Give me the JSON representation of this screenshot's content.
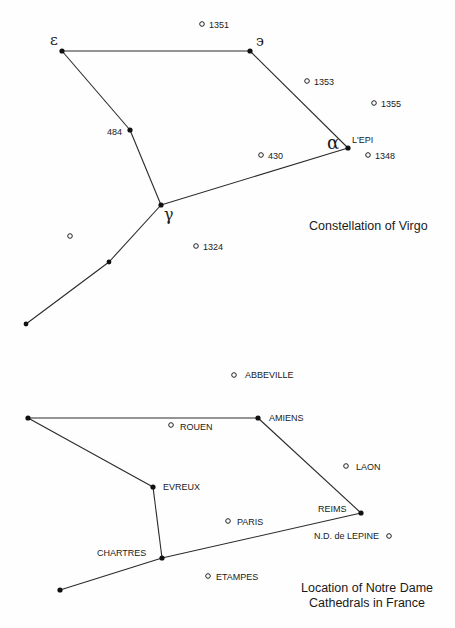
{
  "virgo": {
    "title": "Constellation of Virgo",
    "stars": [
      {
        "id": "epsilon",
        "label": "ε",
        "kind": "greek"
      },
      {
        "id": "eta",
        "label": "э",
        "kind": "greek"
      },
      {
        "id": "s484",
        "label": "484",
        "kind": "text"
      },
      {
        "id": "alpha",
        "label": "α",
        "kind": "greek",
        "sublabel": "L'EPI"
      },
      {
        "id": "gamma",
        "label": "γ",
        "kind": "greek"
      },
      {
        "id": "mid",
        "label": "",
        "kind": "none"
      },
      {
        "id": "end",
        "label": "",
        "kind": "none"
      }
    ],
    "edges": [
      [
        "epsilon",
        "eta"
      ],
      [
        "epsilon",
        "s484"
      ],
      [
        "s484",
        "gamma"
      ],
      [
        "eta",
        "alpha"
      ],
      [
        "alpha",
        "gamma"
      ],
      [
        "gamma",
        "mid"
      ],
      [
        "mid",
        "end"
      ]
    ],
    "other_points": [
      {
        "id": "p1351",
        "label": "1351"
      },
      {
        "id": "p1353",
        "label": "1353"
      },
      {
        "id": "p1355",
        "label": "1355"
      },
      {
        "id": "p430",
        "label": "430"
      },
      {
        "id": "p1348",
        "label": "1348"
      },
      {
        "id": "punl",
        "label": ""
      },
      {
        "id": "p1324",
        "label": "1324"
      }
    ]
  },
  "france": {
    "title_line1": "Location of Notre Dame",
    "title_line2": "Cathedrals in France",
    "cathedrals": [
      {
        "id": "west",
        "label": ""
      },
      {
        "id": "amiens",
        "label": "AMIENS"
      },
      {
        "id": "evreux",
        "label": "EVREUX"
      },
      {
        "id": "reims",
        "label": "REIMS"
      },
      {
        "id": "chartres",
        "label": "CHARTRES"
      },
      {
        "id": "southwest",
        "label": ""
      }
    ],
    "edges": [
      [
        "west",
        "amiens"
      ],
      [
        "west",
        "evreux"
      ],
      [
        "evreux",
        "chartres"
      ],
      [
        "amiens",
        "reims"
      ],
      [
        "reims",
        "chartres"
      ],
      [
        "chartres",
        "southwest"
      ]
    ],
    "other_points": [
      {
        "id": "abbeville",
        "label": "ABBEVILLE"
      },
      {
        "id": "rouen",
        "label": "ROUEN"
      },
      {
        "id": "laon",
        "label": "LAON"
      },
      {
        "id": "paris",
        "label": "PARIS"
      },
      {
        "id": "lepine",
        "label": "N.D. de LEPINE"
      },
      {
        "id": "etampes",
        "label": "ETAMPES"
      }
    ]
  }
}
